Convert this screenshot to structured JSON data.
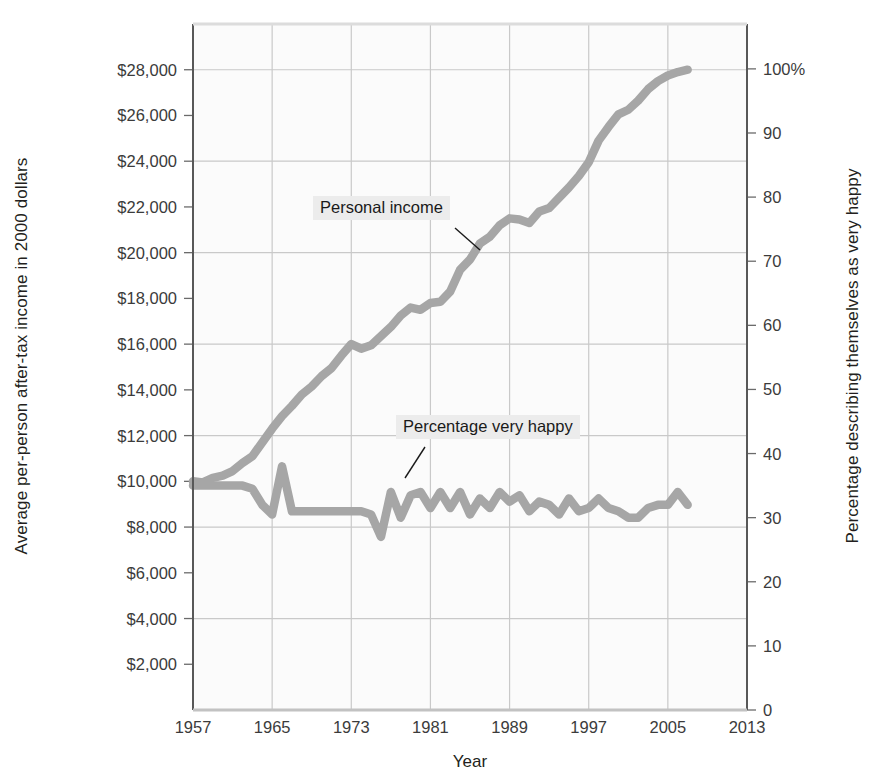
{
  "axes": {
    "y_left": {
      "title": "Average per-person after-tax income in 2000 dollars",
      "ticks": [
        "$2,000",
        "$4,000",
        "$6,000",
        "$8,000",
        "$10,000",
        "$12,000",
        "$14,000",
        "$16,000",
        "$18,000",
        "$20,000",
        "$22,000",
        "$24,000",
        "$26,000",
        "$28,000"
      ],
      "min": 0,
      "max": 30000
    },
    "y_right": {
      "title": "Percentage describing themselves as very happy",
      "ticks": [
        "0",
        "10",
        "20",
        "30",
        "40",
        "50",
        "60",
        "70",
        "80",
        "90",
        "100%"
      ],
      "min": 0,
      "max": 107
    },
    "x": {
      "title": "Year",
      "ticks": [
        "1957",
        "1965",
        "1973",
        "1981",
        "1989",
        "1997",
        "2005",
        "2013"
      ],
      "min": 1957,
      "max": 2013
    }
  },
  "annotations": {
    "income_label": "Personal income",
    "happy_label": "Percentage very happy"
  },
  "colors": {
    "line": "#a6a6a6",
    "grid": "#c9c9c9",
    "axis": "#6b6b6b",
    "plot_background": "#fbfbfb",
    "callout_background": "#ececec",
    "text": "#231f20"
  },
  "chart_data": {
    "type": "line",
    "title": "",
    "xlabel": "Year",
    "ylabel": "Average per-person after-tax income in 2000 dollars",
    "ylabel_right": "Percentage describing themselves as very happy",
    "xlim": [
      1957,
      2013
    ],
    "ylim": [
      0,
      30000
    ],
    "ylim_right": [
      0,
      107
    ],
    "grid": true,
    "legend": "annotated-inline",
    "series": [
      {
        "name": "Personal income",
        "axis": "left",
        "units": "2000 dollars",
        "x": [
          1957,
          1958,
          1959,
          1960,
          1961,
          1962,
          1963,
          1964,
          1965,
          1966,
          1967,
          1968,
          1969,
          1970,
          1971,
          1972,
          1973,
          1974,
          1975,
          1976,
          1977,
          1978,
          1979,
          1980,
          1981,
          1982,
          1983,
          1984,
          1985,
          1986,
          1987,
          1988,
          1989,
          1990,
          1991,
          1992,
          1993,
          1994,
          1995,
          1996,
          1997,
          1998,
          1999,
          2000,
          2001,
          2002,
          2003,
          2004,
          2005,
          2006,
          2007
        ],
        "y": [
          10000,
          9950,
          10150,
          10250,
          10450,
          10800,
          11100,
          11700,
          12300,
          12850,
          13300,
          13800,
          14150,
          14600,
          14950,
          15500,
          16000,
          15800,
          15950,
          16350,
          16750,
          17250,
          17600,
          17500,
          17800,
          17850,
          18300,
          19250,
          19700,
          20400,
          20700,
          21200,
          21500,
          21450,
          21300,
          21800,
          21950,
          22400,
          22850,
          23350,
          23950,
          24900,
          25500,
          26050,
          26250,
          26650,
          27150,
          27500,
          27750,
          27900,
          28000
        ]
      },
      {
        "name": "Percentage very happy",
        "axis": "right",
        "units": "percent",
        "x": [
          1957,
          1958,
          1959,
          1960,
          1961,
          1962,
          1963,
          1964,
          1965,
          1966,
          1967,
          1968,
          1969,
          1970,
          1971,
          1972,
          1973,
          1974,
          1975,
          1976,
          1977,
          1978,
          1979,
          1980,
          1981,
          1982,
          1983,
          1984,
          1985,
          1986,
          1987,
          1988,
          1989,
          1990,
          1991,
          1992,
          1993,
          1994,
          1995,
          1996,
          1997,
          1998,
          1999,
          2000,
          2001,
          2002,
          2003,
          2004,
          2005,
          2006,
          2007
        ],
        "y": [
          35,
          35,
          35,
          35,
          35,
          35,
          34.5,
          32,
          30.5,
          38,
          31,
          31,
          31,
          31,
          31,
          31,
          31,
          31,
          30.5,
          27,
          34,
          30,
          33.5,
          34,
          31.5,
          34,
          31.5,
          34,
          30.5,
          33,
          31.5,
          34,
          32.5,
          33.5,
          31,
          32.5,
          32,
          30.5,
          33,
          31,
          31.5,
          33,
          31.5,
          31,
          30,
          30,
          31.5,
          32,
          32,
          34,
          32
        ]
      }
    ]
  }
}
